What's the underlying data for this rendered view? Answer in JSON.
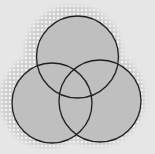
{
  "diagram": {
    "type": "venn",
    "set_count": 3,
    "background_color": "#e6e6e6",
    "fill_color": "#bfbfbf",
    "stroke_color": "#1e1e1e",
    "stroke_width": 1.3,
    "shadow": {
      "style": "halftone-dots",
      "dot_color": "#ffffff",
      "base_color": "#cfcfcf",
      "offset_x": -4,
      "offset_y": -3,
      "spread": 8
    },
    "circles": [
      {
        "id": "top",
        "cx": 77.5,
        "cy": 57,
        "r": 41
      },
      {
        "id": "left",
        "cx": 52,
        "cy": 103,
        "r": 40
      },
      {
        "id": "right",
        "cx": 100,
        "cy": 101,
        "r": 41
      }
    ]
  }
}
